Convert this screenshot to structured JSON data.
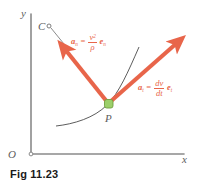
{
  "figure": {
    "caption": "Fig 11.23",
    "background_color": "#ffffff"
  },
  "axes": {
    "y_label": "y",
    "x_label": "x",
    "origin_label": "O",
    "axis_color": "#8a8a8a"
  },
  "points": {
    "center_of_curvature_label": "C",
    "particle_label": "P",
    "particle_marker_color": "#9ccf6a",
    "marker_outline_color": "#6f9e3e"
  },
  "vectors": {
    "color": "#e8654a",
    "normal": {
      "name": "normal-acceleration-vector",
      "label_plain": "a_n = (v^2/rho) e_n",
      "symbol": "a",
      "symbol_sub": "n",
      "equals": "=",
      "numerator": "v",
      "numerator_sup": "2",
      "denominator": "ρ",
      "unit_vector": "e",
      "unit_vector_sub": "n"
    },
    "tangential": {
      "name": "tangential-acceleration-vector",
      "label_plain": "a_t = (dv/dt) e_t",
      "symbol": "a",
      "symbol_sub": "t",
      "equals": "=",
      "numerator": "dv",
      "denominator": "dt",
      "unit_vector": "e",
      "unit_vector_sub": "t"
    }
  },
  "curve": {
    "name": "trajectory-path",
    "color": "#4a4a4a",
    "radius_line_style": "solid-thin"
  }
}
